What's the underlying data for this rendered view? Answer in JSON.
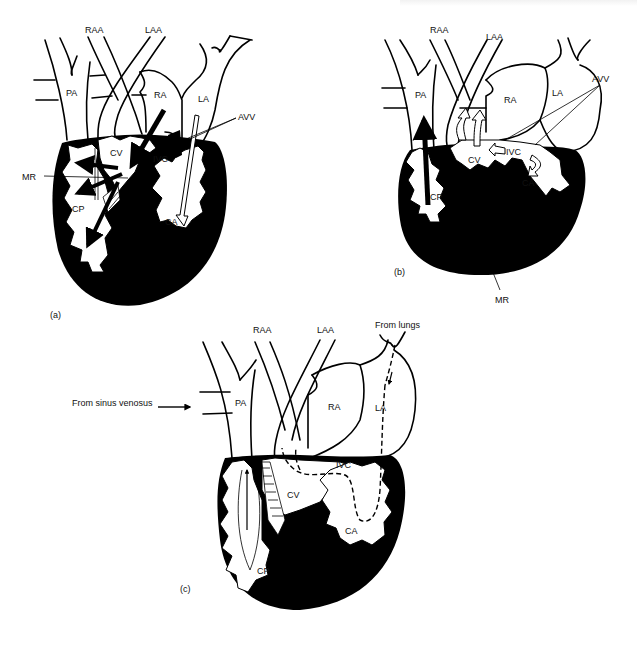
{
  "figure": {
    "panels": [
      {
        "id": "a",
        "caption": "(a)",
        "labels": {
          "RAA": "RAA",
          "LAA": "LAA",
          "PA": "PA",
          "RA": "RA",
          "LA": "LA",
          "AVV": "AVV",
          "CV": "CV",
          "IVC": "IVC",
          "MR": "MR",
          "CP": "CP",
          "CA": "CA"
        }
      },
      {
        "id": "b",
        "caption": "(b)",
        "labels": {
          "RAA": "RAA",
          "LAA": "LAA",
          "PA": "PA",
          "RA": "RA",
          "LA": "LA",
          "AVV": "AVV",
          "CV": "CV",
          "IVC": "IVC",
          "CP": "CP",
          "CA": "CA",
          "MR": "MR"
        }
      },
      {
        "id": "c",
        "caption": "(c)",
        "labels": {
          "RAA": "RAA",
          "LAA": "LAA",
          "PA": "PA",
          "RA": "RA",
          "LA": "LA",
          "IVC": "IVC",
          "CV": "CV",
          "CP": "CP",
          "CA": "CA",
          "from_lungs": "From lungs",
          "from_sinus": "From sinus venosus"
        }
      }
    ],
    "colors": {
      "ink": "#000000",
      "paper": "#ffffff"
    }
  }
}
